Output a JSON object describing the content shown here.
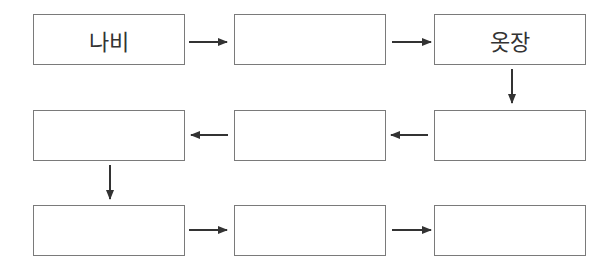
{
  "diagram": {
    "type": "flow-chain",
    "boxes": [
      {
        "id": "r1c1",
        "label": "나비"
      },
      {
        "id": "r1c2",
        "label": ""
      },
      {
        "id": "r1c3",
        "label": "옷장"
      },
      {
        "id": "r2c3",
        "label": ""
      },
      {
        "id": "r2c2",
        "label": ""
      },
      {
        "id": "r2c1",
        "label": ""
      },
      {
        "id": "r3c1",
        "label": ""
      },
      {
        "id": "r3c2",
        "label": ""
      },
      {
        "id": "r3c3",
        "label": ""
      }
    ],
    "arrows": [
      {
        "from": "r1c1",
        "to": "r1c2",
        "direction": "right"
      },
      {
        "from": "r1c2",
        "to": "r1c3",
        "direction": "right"
      },
      {
        "from": "r1c3",
        "to": "r2c3",
        "direction": "down"
      },
      {
        "from": "r2c3",
        "to": "r2c2",
        "direction": "left"
      },
      {
        "from": "r2c2",
        "to": "r2c1",
        "direction": "left"
      },
      {
        "from": "r2c1",
        "to": "r3c1",
        "direction": "down"
      },
      {
        "from": "r3c1",
        "to": "r3c2",
        "direction": "right"
      },
      {
        "from": "r3c2",
        "to": "r3c3",
        "direction": "right"
      }
    ],
    "colors": {
      "border": "#7a7a7a",
      "arrow": "#333333",
      "text": "#333333"
    }
  }
}
